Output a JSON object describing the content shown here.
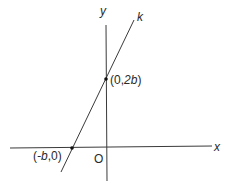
{
  "figure": {
    "type": "coordinate-plane-line",
    "axes": {
      "x_label": "x",
      "y_label": "y",
      "origin_label": "O"
    },
    "line": {
      "label": "k"
    },
    "points": [
      {
        "label_prefix": "(",
        "label_var": "-b",
        "label_suffix": ",0)",
        "full_label": "(-b,0)"
      },
      {
        "label_prefix": "(0,",
        "label_var": "2b",
        "label_suffix": ")",
        "full_label": "(0,2b)"
      }
    ],
    "colors": {
      "axis": "#3a3a3a",
      "line": "#3a3a3a",
      "point": "#111111",
      "text": "#2a2a2a"
    }
  }
}
